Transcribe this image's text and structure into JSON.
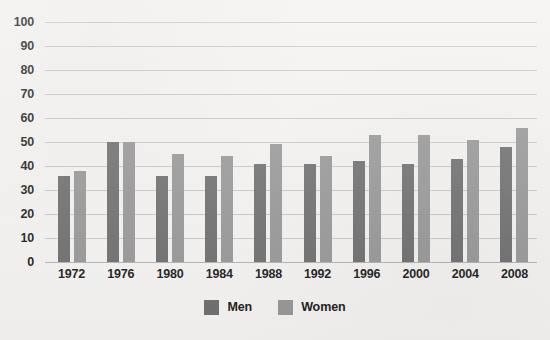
{
  "chart_data": {
    "type": "bar",
    "title": "",
    "subtitle": "",
    "xlabel": "",
    "ylabel": "",
    "categories": [
      "1972",
      "1976",
      "1980",
      "1984",
      "1988",
      "1992",
      "1996",
      "2000",
      "2004",
      "2008"
    ],
    "series": [
      {
        "name": "Men",
        "color": "#6d6d6d",
        "values": [
          36,
          50,
          36,
          36,
          41,
          41,
          42,
          41,
          43,
          48
        ]
      },
      {
        "name": "Women",
        "color": "#969696",
        "values": [
          38,
          50,
          45,
          44,
          49,
          44,
          53,
          53,
          51,
          56
        ]
      }
    ],
    "ylim": [
      0,
      100
    ],
    "y_ticks": [
      0,
      10,
      20,
      30,
      40,
      50,
      60,
      70,
      80,
      90,
      100
    ],
    "y_tick_labels": [
      "0",
      "10",
      "20",
      "30",
      "40",
      "50",
      "60",
      "70",
      "80",
      "90",
      "100"
    ],
    "grid": true,
    "legend_position": "bottom",
    "background_color": "#f3f2f0",
    "gridline_color": "#c9c7c4",
    "text_color": "#1b1b1b"
  },
  "legend": {
    "entries": [
      {
        "label": "Men",
        "color": "#6d6d6d"
      },
      {
        "label": "Women",
        "color": "#969696"
      }
    ]
  }
}
